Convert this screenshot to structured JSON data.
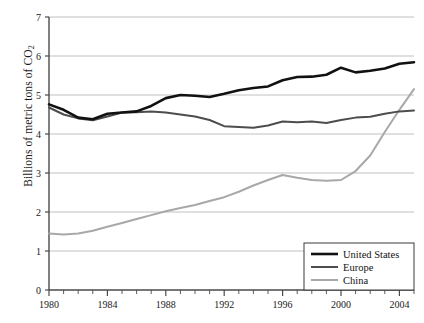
{
  "chart_data": {
    "type": "line",
    "title": "",
    "xlabel": "",
    "ylabel": "Billions of metric tons of CO",
    "ylabel_sub": "2",
    "xlim": [
      1980,
      2005
    ],
    "ylim": [
      0,
      7
    ],
    "grid": true,
    "legend_position": "bottom-right",
    "x": [
      1980,
      1981,
      1982,
      1983,
      1984,
      1985,
      1986,
      1987,
      1988,
      1989,
      1990,
      1991,
      1992,
      1993,
      1994,
      1995,
      1996,
      1997,
      1998,
      1999,
      2000,
      2001,
      2002,
      2003,
      2004,
      2005
    ],
    "xticks": [
      1980,
      1984,
      1988,
      1992,
      1996,
      2000,
      2004
    ],
    "xtick_labels": [
      "1980",
      "1984",
      "1988",
      "1992",
      "1996",
      "2000",
      "2004"
    ],
    "yticks": [
      0,
      1,
      2,
      3,
      4,
      5,
      6,
      7
    ],
    "ytick_labels": [
      "0",
      "1",
      "2",
      "3",
      "4",
      "5",
      "6",
      "7"
    ],
    "series": [
      {
        "name": "United States",
        "color": "#111111",
        "width": 2.6,
        "values": [
          4.76,
          4.62,
          4.42,
          4.38,
          4.52,
          4.55,
          4.58,
          4.72,
          4.92,
          5.0,
          4.98,
          4.95,
          5.03,
          5.12,
          5.18,
          5.22,
          5.38,
          5.46,
          5.47,
          5.52,
          5.7,
          5.58,
          5.62,
          5.68,
          5.8,
          5.84
        ]
      },
      {
        "name": "Europe",
        "color": "#4d4d4d",
        "width": 2.0,
        "values": [
          4.68,
          4.5,
          4.4,
          4.35,
          4.45,
          4.55,
          4.56,
          4.58,
          4.55,
          4.5,
          4.45,
          4.36,
          4.2,
          4.18,
          4.16,
          4.22,
          4.32,
          4.3,
          4.32,
          4.28,
          4.36,
          4.42,
          4.44,
          4.52,
          4.58,
          4.6
        ]
      },
      {
        "name": "China",
        "color": "#a8a8a8",
        "width": 2.0,
        "values": [
          1.45,
          1.42,
          1.45,
          1.52,
          1.62,
          1.72,
          1.82,
          1.92,
          2.02,
          2.1,
          2.18,
          2.28,
          2.38,
          2.52,
          2.68,
          2.82,
          2.95,
          2.88,
          2.82,
          2.8,
          2.82,
          3.05,
          3.45,
          4.05,
          4.62,
          5.15
        ]
      }
    ]
  }
}
